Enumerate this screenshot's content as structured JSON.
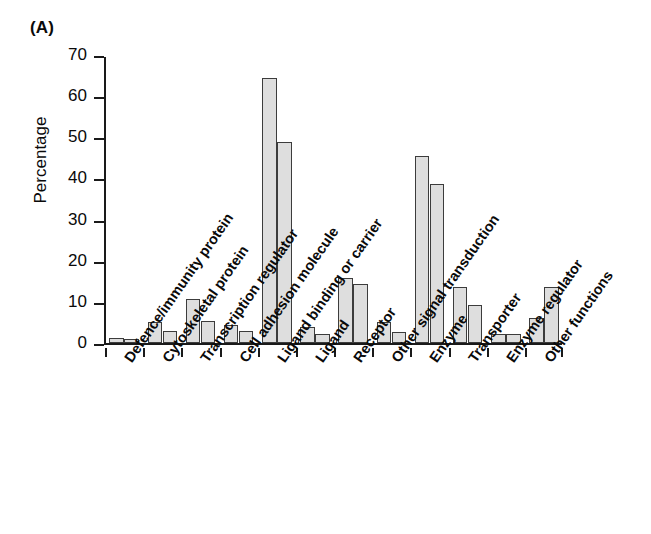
{
  "panel": {
    "label": "(A)"
  },
  "axes": {
    "ylabel": "Percentage",
    "yticks": [
      "0",
      "10",
      "20",
      "30",
      "40",
      "50",
      "60",
      "70"
    ],
    "xlabel": ""
  },
  "colors": {
    "bar_fill": "#dedede",
    "bar_stroke": "#3c3c3c",
    "axis": "#1a1a1a",
    "text": "#0a0a0a",
    "background": "#ffffff"
  },
  "categories": [
    "Defence/immunity protein",
    "Cytoskeletal protein",
    "Transcription regulator",
    "Cell adhesion molecule",
    "Ligand binding or carrier",
    "Ligand",
    "Receptor",
    "Other signal transduction",
    "Enzyme",
    "Transporter",
    "Enzyme regulator",
    "Other functions"
  ],
  "chart_data": {
    "type": "bar",
    "title": "(A)",
    "xlabel": "",
    "ylabel": "Percentage",
    "ylim": [
      0,
      70
    ],
    "ytick_step": 10,
    "grid": false,
    "legend": "none",
    "categories": [
      "Defence/immunity protein",
      "Cytoskeletal protein",
      "Transcription regulator",
      "Cell adhesion molecule",
      "Ligand binding or carrier",
      "Ligand",
      "Receptor",
      "Other signal transduction",
      "Enzyme",
      "Transporter",
      "Enzyme regulator",
      "Other functions"
    ],
    "series": [
      {
        "name": "Series 1",
        "values": [
          1.1,
          5.0,
          10.7,
          4.3,
          64.5,
          3.8,
          15.7,
          5.2,
          45.5,
          13.5,
          2.3,
          6.0
        ]
      },
      {
        "name": "Series 2",
        "values": [
          1.0,
          3.0,
          5.4,
          2.8,
          48.8,
          2.2,
          14.3,
          2.7,
          38.7,
          9.3,
          2.1,
          13.6
        ]
      }
    ]
  }
}
